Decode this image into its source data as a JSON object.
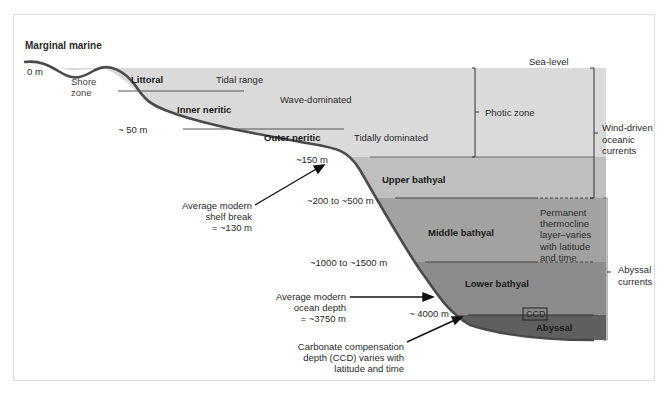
{
  "diagram": {
    "title": "Marginal marine",
    "sea_level_label": "Sea-level",
    "zones": {
      "shore_zone": "Shore\nzone",
      "littoral": "Littoral",
      "tidal_range": "Tidal range",
      "inner_neritic": "Inner neritic",
      "wave_dominated": "Wave-dominated",
      "outer_neritic": "Outer neritic",
      "tidally_dominated": "Tidally dominated",
      "upper_bathyal": "Upper bathyal",
      "middle_bathyal": "Middle bathyal",
      "lower_bathyal": "Lower bathyal",
      "abyssal": "Abyssal",
      "ccd_box": "CCD"
    },
    "depths": {
      "d0": "0 m",
      "d50": "~ 50 m",
      "d150": "~150 m",
      "d200_500": "~200 to ~500 m",
      "d1000_1500": "~1000 to ~1500 m",
      "d4000": "~ 4000 m"
    },
    "brackets": {
      "photic_zone": "Photic zone",
      "wind_driven": "Wind-driven\noceanic\ncurrents",
      "abyssal_currents": "Abyssal\ncurrents",
      "thermocline": "Permanent\nthermocline\nlayer–varies\nwith latitude\nand time"
    },
    "annotations": {
      "shelf_break": "Average modern\nshelf break\n= ~130 m",
      "ocean_depth": "Average modern\nocean depth\n= ~3750 m",
      "ccd": "Carbonate compensation\ndepth (CCD) varies with\nlatitude and time"
    },
    "colors": {
      "neritic": "#dadada",
      "upper_bathyal": "#bfbfbf",
      "middle_bathyal": "#a2a2a2",
      "lower_bathyal": "#8c8c8c",
      "abyssal": "#5f5f5f",
      "seafloor_line": "#4a4a4a"
    }
  }
}
